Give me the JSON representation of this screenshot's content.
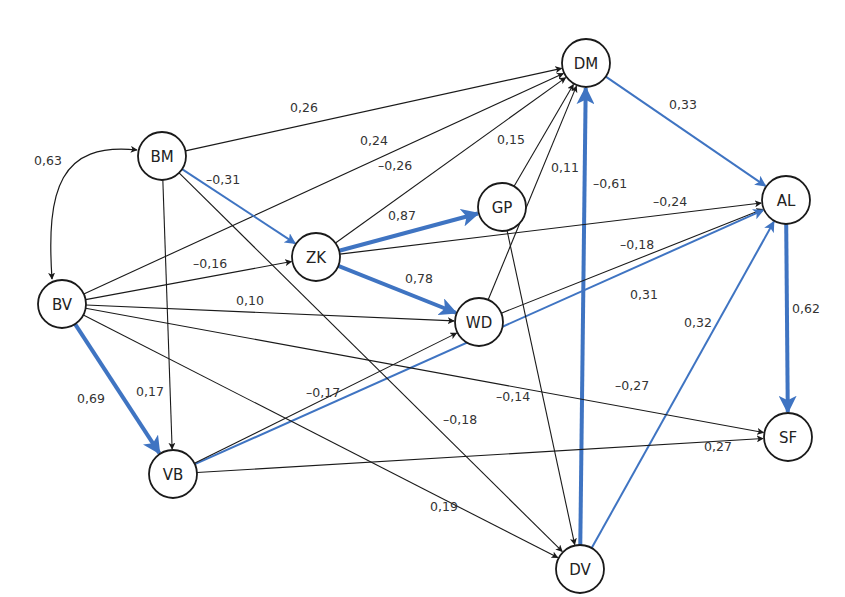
{
  "colors": {
    "black": "#1a1a1a",
    "blue": "#3f74c2"
  },
  "nodes": [
    {
      "id": "BV",
      "label": "BV",
      "x": 62,
      "y": 304
    },
    {
      "id": "BM",
      "label": "BM",
      "x": 162,
      "y": 156
    },
    {
      "id": "ZK",
      "label": "ZK",
      "x": 316,
      "y": 257
    },
    {
      "id": "GP",
      "label": "GP",
      "x": 502,
      "y": 207
    },
    {
      "id": "WD",
      "label": "WD",
      "x": 479,
      "y": 322
    },
    {
      "id": "DM",
      "label": "DM",
      "x": 586,
      "y": 63
    },
    {
      "id": "AL",
      "label": "AL",
      "x": 786,
      "y": 200
    },
    {
      "id": "SF",
      "label": "SF",
      "x": 788,
      "y": 437
    },
    {
      "id": "VB",
      "label": "VB",
      "x": 173,
      "y": 474
    },
    {
      "id": "DV",
      "label": "DV",
      "x": 580,
      "y": 569
    }
  ],
  "edges": [
    {
      "from": "BM",
      "to": "DM",
      "label": "0,26",
      "style": "thin",
      "lx": 290,
      "ly": 112
    },
    {
      "from": "BV",
      "to": "DM",
      "label": "0,24",
      "style": "thin",
      "lx": 360,
      "ly": 145
    },
    {
      "from": "ZK",
      "to": "DM",
      "label": "–0,26",
      "style": "thin",
      "lx": 378,
      "ly": 170
    },
    {
      "from": "GP",
      "to": "DM",
      "label": "0,15",
      "style": "thin",
      "lx": 497,
      "ly": 144
    },
    {
      "from": "WD",
      "to": "DM",
      "label": "0,11",
      "style": "thin",
      "lx": 551,
      "ly": 172
    },
    {
      "from": "DV",
      "to": "DM",
      "label": "–0,61",
      "style": "thick",
      "lx": 593,
      "ly": 188
    },
    {
      "from": "BM",
      "to": "ZK",
      "label": "–0,31",
      "style": "blue",
      "lx": 206,
      "ly": 184
    },
    {
      "from": "BV",
      "to": "ZK",
      "label": "–0,16",
      "style": "thin",
      "lx": 193,
      "ly": 268
    },
    {
      "from": "ZK",
      "to": "GP",
      "label": "0,87",
      "style": "thick",
      "lx": 388,
      "ly": 220
    },
    {
      "from": "ZK",
      "to": "WD",
      "label": "0,78",
      "style": "thick",
      "lx": 405,
      "ly": 283
    },
    {
      "from": "ZK",
      "to": "AL",
      "label": "–0,24",
      "style": "thin",
      "lx": 653,
      "ly": 206
    },
    {
      "from": "WD",
      "to": "AL",
      "label": "–0,18",
      "style": "thin",
      "lx": 620,
      "ly": 249
    },
    {
      "from": "VB",
      "to": "AL",
      "label": "0,31",
      "style": "blue",
      "lx": 630,
      "ly": 299
    },
    {
      "from": "DV",
      "to": "AL",
      "label": "0,32",
      "style": "blue",
      "lx": 684,
      "ly": 327
    },
    {
      "from": "DM",
      "to": "AL",
      "label": "0,33",
      "style": "blue",
      "lx": 669,
      "ly": 109
    },
    {
      "from": "BV",
      "to": "WD",
      "label": "0,10",
      "style": "thin",
      "lx": 236,
      "ly": 305
    },
    {
      "from": "VB",
      "to": "WD",
      "label": "–0,17",
      "style": "thin",
      "lx": 306,
      "ly": 397
    },
    {
      "from": "BV",
      "to": "VB",
      "label": "0,69",
      "style": "thick",
      "lx": 77,
      "ly": 403
    },
    {
      "from": "BM",
      "to": "VB",
      "label": "0,17",
      "style": "thin",
      "lx": 136,
      "ly": 396
    },
    {
      "from": "BV",
      "to": "SF",
      "label": "–0,27",
      "style": "thin",
      "lx": 615,
      "ly": 390
    },
    {
      "from": "VB",
      "to": "SF",
      "label": "0,27",
      "style": "thin",
      "lx": 704,
      "ly": 451
    },
    {
      "from": "AL",
      "to": "SF",
      "label": "0,62",
      "style": "thick",
      "lx": 792,
      "ly": 313
    },
    {
      "from": "BM",
      "to": "DV",
      "label": "–0,18",
      "style": "thin",
      "lx": 443,
      "ly": 424
    },
    {
      "from": "GP",
      "to": "DV",
      "label": "–0,14",
      "style": "thin",
      "lx": 496,
      "ly": 401
    },
    {
      "from": "BV",
      "to": "DV",
      "label": "0,19",
      "style": "thin",
      "lx": 430,
      "ly": 511
    }
  ],
  "correlation": {
    "between": [
      "BV",
      "BM"
    ],
    "label": "0,63",
    "lx": 34,
    "ly": 165
  }
}
